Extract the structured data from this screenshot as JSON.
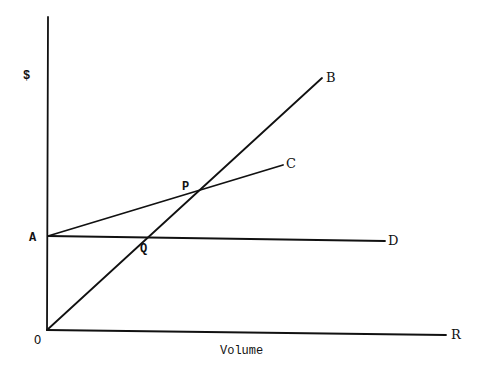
{
  "diagram": {
    "type": "break-even chart",
    "y_axis_label": "$",
    "x_axis_label": "Volume",
    "points": {
      "origin": "O",
      "A": "A",
      "B": "B",
      "C": "C",
      "D": "D",
      "P": "P",
      "Q": "Q",
      "R": "R"
    },
    "lines": [
      {
        "name": "OB",
        "from": "O",
        "to": "B",
        "description": "line from origin rising steeply"
      },
      {
        "name": "AC",
        "from": "A",
        "to": "C",
        "description": "line from A rising gently"
      },
      {
        "name": "AD",
        "from": "A",
        "to": "D",
        "description": "horizontal line from A"
      },
      {
        "name": "OR",
        "from": "O",
        "to": "R",
        "description": "horizontal axis"
      }
    ],
    "intersections": [
      {
        "label": "P",
        "lines": [
          "OB",
          "AC"
        ]
      },
      {
        "label": "Q",
        "lines": [
          "OB",
          "AD"
        ]
      }
    ],
    "colors": {
      "stroke": "#111111",
      "background": "#ffffff"
    }
  }
}
